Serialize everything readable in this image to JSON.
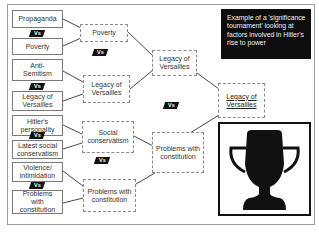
{
  "note": {
    "text": "Example of a 'significance tournament' looking at factors involved in Hitler's rise to power"
  },
  "vs_label": "Vs",
  "round1": [
    {
      "top": "Propaganda",
      "bottom": "Poverty"
    },
    {
      "top": "Anti-Semitism",
      "bottom": "Legacy of Versailles"
    },
    {
      "top": "Hitler's personality",
      "bottom": "Latest social conservatism"
    },
    {
      "top": "Violence/ intimidation",
      "bottom": "Problems with constitution"
    }
  ],
  "round2": [
    {
      "top": "Poverty",
      "bottom": "Legacy of Versailles"
    },
    {
      "top": "Social conservatism",
      "bottom": "Problems with constitution"
    }
  ],
  "round3": {
    "top": "Legacy of Versailles",
    "bottom": "Problems with constitution"
  },
  "winner": "Legacy of Versailles",
  "trophy": {
    "icon": "trophy-icon",
    "color": "#111111"
  },
  "colors": {
    "note_bg": "#0d0d0d",
    "vs_bg": "#111111",
    "border": "#7a7a7a"
  }
}
